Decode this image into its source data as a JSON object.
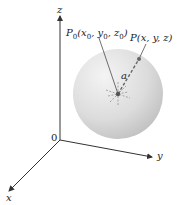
{
  "diagram": {
    "axes": {
      "z_label": "z",
      "y_label": "y",
      "x_label": "x",
      "origin_label": "0"
    },
    "center_point": {
      "label": "P",
      "sub": "0",
      "coords_text": "(x",
      "x_sub": "0",
      "sep1": ", y",
      "y_sub": "0",
      "sep2": ", z",
      "z_sub": "0",
      "close": ")"
    },
    "surface_point": {
      "label": "P(x, y, z)"
    },
    "radius_label": "a",
    "colors": {
      "sphere_light": "#f2f2f2",
      "sphere_dark": "#bdbdbd",
      "axis": "#333333",
      "dash": "#555555"
    }
  }
}
